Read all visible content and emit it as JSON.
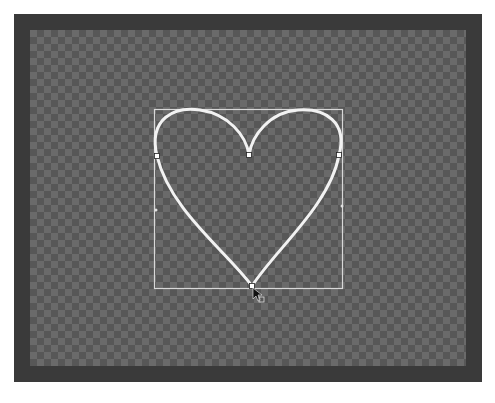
{
  "canvas": {
    "frame_color": "#3a3a3a",
    "checker_light": "#6a6a6a",
    "checker_dark": "#575757"
  },
  "shape": {
    "name": "heart",
    "stroke_color": "#f2f2f2",
    "bounding_box": {
      "x": 154,
      "y": 109,
      "width": 188,
      "height": 179
    },
    "anchors": [
      {
        "name": "left",
        "x": 157,
        "y": 156
      },
      {
        "name": "top-center",
        "x": 249,
        "y": 155
      },
      {
        "name": "right",
        "x": 339,
        "y": 155
      },
      {
        "name": "bottom",
        "x": 252,
        "y": 286
      }
    ]
  },
  "cursor": {
    "type": "direct-selection-arrow",
    "x": 253,
    "y": 288
  },
  "caption": ""
}
